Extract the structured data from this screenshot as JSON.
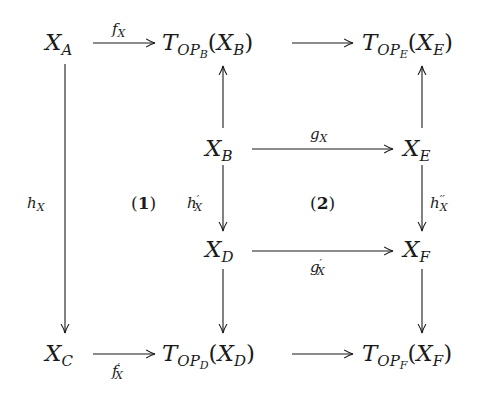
{
  "diagram": {
    "type": "commutative-diagram",
    "nodes": {
      "XA": {
        "base": "X",
        "sub": "A"
      },
      "TB": {
        "op": "T",
        "opsub": "OP",
        "opsubsub": "B",
        "arg_base": "X",
        "arg_sub": "B"
      },
      "TE": {
        "op": "T",
        "opsub": "OP",
        "opsubsub": "E",
        "arg_base": "X",
        "arg_sub": "E"
      },
      "XB": {
        "base": "X",
        "sub": "B"
      },
      "XE": {
        "base": "X",
        "sub": "E"
      },
      "XD": {
        "base": "X",
        "sub": "D"
      },
      "XF": {
        "base": "X",
        "sub": "F"
      },
      "XC": {
        "base": "X",
        "sub": "C"
      },
      "TD": {
        "op": "T",
        "opsub": "OP",
        "opsubsub": "D",
        "arg_base": "X",
        "arg_sub": "D"
      },
      "TF": {
        "op": "T",
        "opsub": "OP",
        "opsubsub": "F",
        "arg_base": "X",
        "arg_sub": "F"
      }
    },
    "morphisms": {
      "fX": {
        "base": "f",
        "sub": "X",
        "prime": ""
      },
      "gX": {
        "base": "g",
        "sub": "X",
        "prime": ""
      },
      "hX": {
        "base": "h",
        "sub": "X",
        "prime": ""
      },
      "h1X": {
        "base": "h",
        "sub": "X",
        "prime": "′"
      },
      "h2X": {
        "base": "h",
        "sub": "X",
        "prime": "′′"
      },
      "g1X": {
        "base": "g",
        "sub": "X",
        "prime": "′"
      },
      "f1X": {
        "base": "f",
        "sub": "X",
        "prime": "′"
      }
    },
    "regions": {
      "r1": {
        "open": "(",
        "num": "1",
        "close": ")"
      },
      "r2": {
        "open": "(",
        "num": "2",
        "close": ")"
      }
    },
    "edges": [
      {
        "from": "XA",
        "to": "TB",
        "label": "fX"
      },
      {
        "from": "TB",
        "to": "TE",
        "label": ""
      },
      {
        "from": "XB",
        "to": "TB",
        "label": ""
      },
      {
        "from": "XE",
        "to": "TE",
        "label": ""
      },
      {
        "from": "XB",
        "to": "XE",
        "label": "gX"
      },
      {
        "from": "XB",
        "to": "XD",
        "label": "h1X"
      },
      {
        "from": "XE",
        "to": "XF",
        "label": "h2X"
      },
      {
        "from": "XD",
        "to": "XF",
        "label": "g1X"
      },
      {
        "from": "XA",
        "to": "XC",
        "label": "hX"
      },
      {
        "from": "XD",
        "to": "TD",
        "label": ""
      },
      {
        "from": "XF",
        "to": "TF",
        "label": ""
      },
      {
        "from": "XC",
        "to": "TD",
        "label": "f1X"
      },
      {
        "from": "TD",
        "to": "TF",
        "label": ""
      }
    ],
    "colors": {
      "ink": "#1a1a1a",
      "background": "#ffffff"
    }
  }
}
